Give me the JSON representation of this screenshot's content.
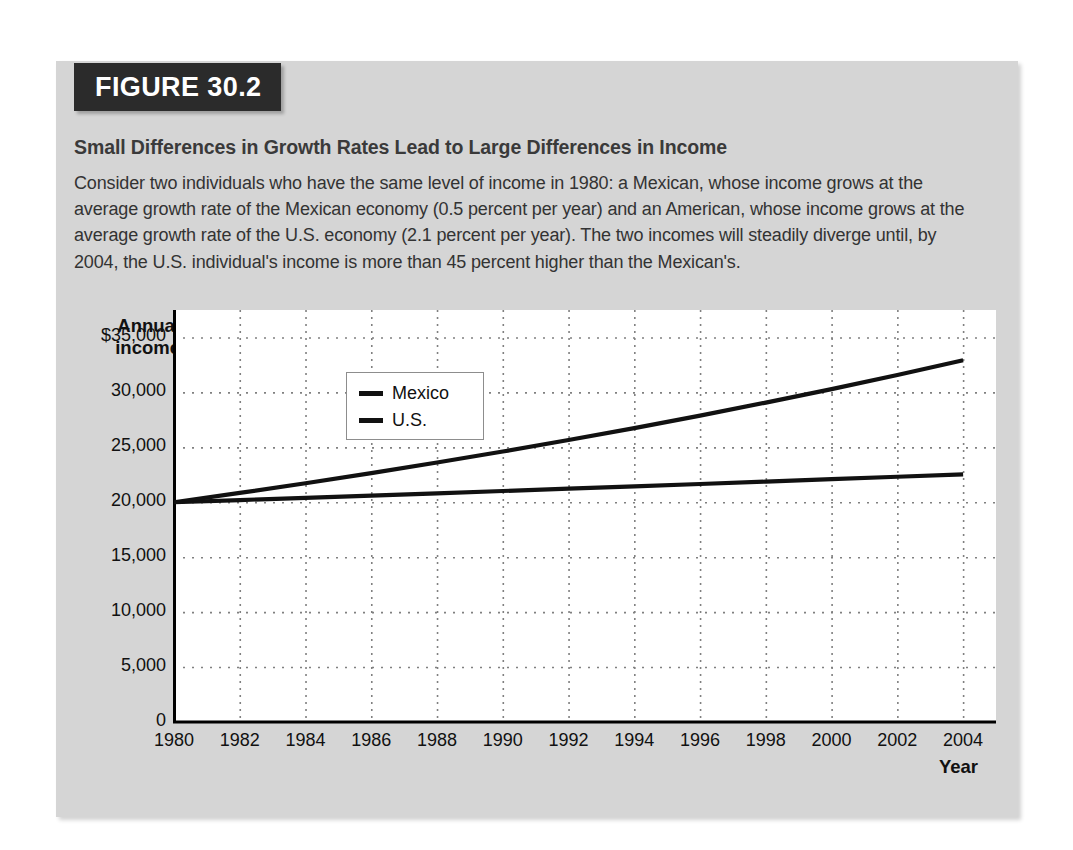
{
  "figure": {
    "tag_label": "FIGURE 30.2",
    "subtitle": "Small Differences in Growth Rates Lead to Large Differences in Income",
    "caption": "Consider two individuals who have the same level of income in 1980: a Mexican, whose income grows at the average growth rate of the Mexican economy (0.5 percent per year) and an American, whose income grows at the average growth rate of the U.S. economy (2.1 percent per year). The two incomes will steadily diverge until, by 2004, the U.S. individual's income is more than 45 percent higher than the Mexican's."
  },
  "colors": {
    "panel_background": "#d5d5d5",
    "tag_background": "#2b2b2b",
    "tag_text": "#ffffff",
    "plot_background": "#ffffff",
    "line": "#111111",
    "gridline": "#808080",
    "axis": "#000000"
  },
  "chart_data": {
    "type": "line",
    "title": "Small Differences in Growth Rates Lead to Large Differences in Income",
    "xlabel": "Year",
    "ylabel": "Annual income",
    "ylabel_line1": "Annual",
    "ylabel_line2": "income",
    "grid": true,
    "legend_position": "upper-left-inside",
    "xlim": [
      1980,
      2005
    ],
    "ylim": [
      0,
      37500
    ],
    "x": [
      1980,
      1982,
      1984,
      1986,
      1988,
      1990,
      1992,
      1994,
      1996,
      1998,
      2000,
      2002,
      2004
    ],
    "xticks": [
      "1980",
      "1982",
      "1984",
      "1986",
      "1988",
      "1990",
      "1992",
      "1994",
      "1996",
      "1998",
      "2000",
      "2002",
      "2004"
    ],
    "yticks": [
      "$35,000",
      "30,000",
      "25,000",
      "20,000",
      "15,000",
      "10,000",
      "5,000",
      "0"
    ],
    "ytick_values": [
      35000,
      30000,
      25000,
      20000,
      15000,
      10000,
      5000,
      0
    ],
    "series": [
      {
        "name": "Mexico",
        "growth_rate_percent": 0.5,
        "values": [
          20000,
          20200,
          20403,
          20608,
          20815,
          21024,
          21235,
          21448,
          21663,
          21881,
          22101,
          22323,
          22547
        ]
      },
      {
        "name": "U.S.",
        "growth_rate_percent": 2.1,
        "values": [
          20000,
          20849,
          21734,
          22656,
          23617,
          24619,
          25663,
          26752,
          27887,
          29070,
          30303,
          31589,
          32929
        ]
      }
    ]
  }
}
